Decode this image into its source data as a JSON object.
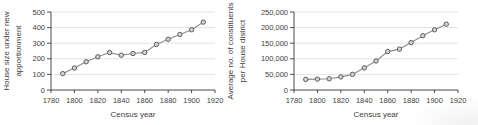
{
  "figure": {
    "background": "#ffffff",
    "text_color": "#404040"
  },
  "chart_data": [
    {
      "type": "line",
      "title": "",
      "xlabel": "Census year",
      "ylabel_lines": [
        "House size under new",
        "apportionment"
      ],
      "x": [
        1790,
        1800,
        1810,
        1820,
        1830,
        1840,
        1850,
        1860,
        1870,
        1880,
        1890,
        1900,
        1910
      ],
      "values": [
        105,
        141,
        181,
        213,
        240,
        223,
        234,
        241,
        292,
        325,
        356,
        386,
        435
      ],
      "xlim": [
        1780,
        1920
      ],
      "ylim": [
        0,
        500
      ],
      "xticks": [
        1780,
        1800,
        1820,
        1840,
        1860,
        1880,
        1900,
        1920
      ],
      "xtick_labels": [
        "1780",
        "1800",
        "1820",
        "1840",
        "1860",
        "1880",
        "1900",
        "1920"
      ],
      "yticks": [
        0,
        100,
        200,
        300,
        400,
        500
      ],
      "ytick_labels": [
        "0",
        "100",
        "200",
        "300",
        "400",
        "500"
      ],
      "grid": "horizontal",
      "legend": "none",
      "marker": "circle",
      "colors": {
        "line": "#8f8f8f",
        "marker_fill": "#d4d4d4",
        "marker_stroke": "#5c5c5c",
        "grid": "#e3e3e3",
        "axis": "#4a4a4a",
        "text": "#404040"
      }
    },
    {
      "type": "line",
      "title": "",
      "xlabel": "Census year",
      "ylabel_lines": [
        "Average no. of constituents",
        "per House district"
      ],
      "x": [
        1790,
        1800,
        1810,
        1820,
        1830,
        1840,
        1850,
        1860,
        1870,
        1880,
        1890,
        1900,
        1910
      ],
      "values": [
        34000,
        35000,
        36000,
        42000,
        50000,
        71000,
        93000,
        123000,
        131000,
        152000,
        174000,
        193000,
        211000
      ],
      "xlim": [
        1780,
        1920
      ],
      "ylim": [
        0,
        250000
      ],
      "xticks": [
        1780,
        1800,
        1820,
        1840,
        1860,
        1880,
        1900,
        1920
      ],
      "xtick_labels": [
        "1780",
        "1800",
        "1820",
        "1840",
        "1860",
        "1880",
        "1900",
        "1920"
      ],
      "yticks": [
        0,
        50000,
        100000,
        150000,
        200000,
        250000
      ],
      "ytick_labels": [
        "0",
        "50,000",
        "100,000",
        "150,000",
        "200,000",
        "250,000"
      ],
      "grid": "horizontal",
      "legend": "none",
      "marker": "circle",
      "colors": {
        "line": "#8f8f8f",
        "marker_fill": "#d4d4d4",
        "marker_stroke": "#5c5c5c",
        "grid": "#e3e3e3",
        "axis": "#4a4a4a",
        "text": "#404040"
      }
    }
  ]
}
